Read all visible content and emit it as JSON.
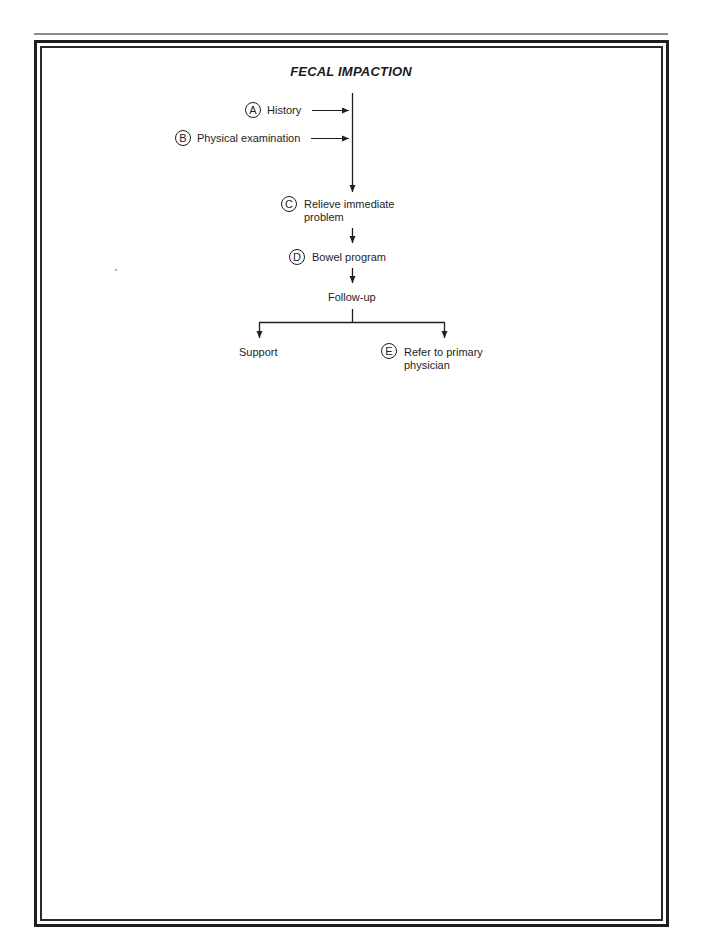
{
  "title": "FECAL IMPACTION",
  "nodes": {
    "A": {
      "letter": "A",
      "label": "History"
    },
    "B": {
      "letter": "B",
      "label": "Physical examination"
    },
    "C": {
      "letter": "C",
      "label_line1": "Relieve immediate",
      "label_line2": "problem"
    },
    "D": {
      "letter": "D",
      "label": "Bowel program"
    },
    "followup": {
      "label": "Follow-up"
    },
    "support": {
      "label": "Support"
    },
    "E": {
      "letter": "E",
      "label_line1": "Refer to primary",
      "label_line2": "physician"
    }
  },
  "colors": {
    "line": "#1e1e1e",
    "rule": "#8a8a8a"
  }
}
